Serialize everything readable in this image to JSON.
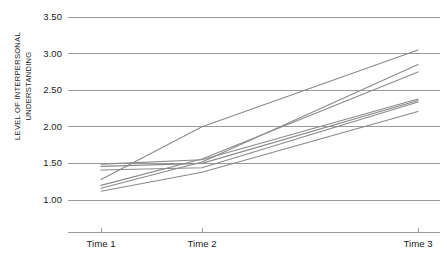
{
  "chart_data": {
    "type": "line",
    "title": "",
    "subtitle": "",
    "xlabel": "",
    "ylabel": "LEVEL OF INTERPERSONAL\nUNDERSTANDING",
    "categories": [
      "Time 1",
      "Time 2",
      "Time 3"
    ],
    "x_tick_labels": [
      "Time 1",
      "Time 2",
      "Time 3"
    ],
    "y_tick_labels": [
      "1.00",
      "1.50",
      "2.00",
      "2.50",
      "3.00",
      "3.50"
    ],
    "y_tick_values": [
      1.0,
      1.5,
      2.0,
      2.5,
      3.0,
      3.5
    ],
    "ylim": [
      1.0,
      3.5
    ],
    "grid": "horizontal",
    "legend": "none",
    "line_color": "#8a8a8a",
    "axis_color": "#9a9a9a",
    "text_color": "#1a1a1a",
    "series": [
      {
        "name": "Participant 1",
        "values": [
          1.28,
          2.0,
          3.05
        ]
      },
      {
        "name": "Participant 2",
        "values": [
          1.16,
          1.52,
          2.85
        ]
      },
      {
        "name": "Participant 3",
        "values": [
          1.2,
          1.56,
          2.75
        ]
      },
      {
        "name": "Participant 4",
        "values": [
          1.49,
          1.55,
          2.38
        ]
      },
      {
        "name": "Participant 5",
        "values": [
          1.46,
          1.5,
          2.36
        ]
      },
      {
        "name": "Participant 6",
        "values": [
          1.41,
          1.44,
          2.34
        ]
      },
      {
        "name": "Participant 7",
        "values": [
          1.12,
          1.38,
          2.21
        ]
      }
    ]
  },
  "axis": {
    "y_labels": [
      "3.50",
      "3.00",
      "2.50",
      "2.00",
      "1.50",
      "1.00"
    ],
    "x_labels": [
      "Time 1",
      "Time 2",
      "Time 3"
    ],
    "y_title": "LEVEL OF INTERPERSONAL\nUNDERSTANDING"
  }
}
